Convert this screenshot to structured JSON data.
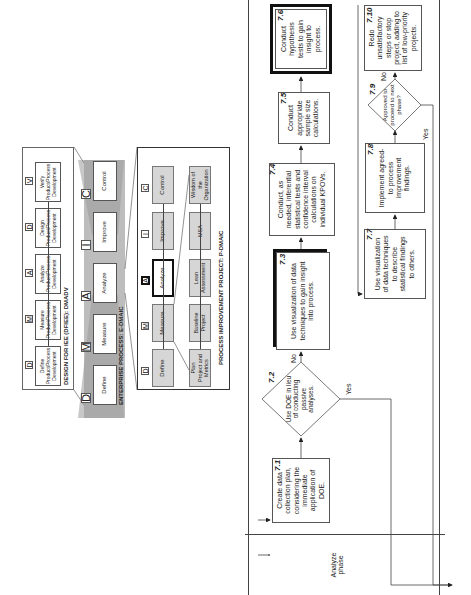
{
  "orientation": "rotated-90-ccw",
  "dmadv": {
    "title": "DESIGN FOR IEE (DFIEE): DMADV",
    "steps": [
      {
        "letter": "D",
        "label": "Define Product/Process Development"
      },
      {
        "letter": "M",
        "label": "Measure Product/Process Development"
      },
      {
        "letter": "A",
        "label": "Analyze Product/Process Development"
      },
      {
        "letter": "D",
        "label": "Design Product/Process Development"
      },
      {
        "letter": "V",
        "label": "Verify Product/Process Development"
      }
    ]
  },
  "edmaic": {
    "title": "ENTERPRISE PROCESS: E-DMAIC",
    "steps": [
      {
        "letter": "D",
        "label": "Define"
      },
      {
        "letter": "M",
        "label": "Measure"
      },
      {
        "letter": "A",
        "label": "Analyze"
      },
      {
        "letter": "I",
        "label": "Improve"
      },
      {
        "letter": "C",
        "label": "Control"
      }
    ]
  },
  "pdmaic": {
    "title": "PROCESS IMPROVEMENT PROJECT: P-DMAIC",
    "steps": [
      {
        "letter": "D",
        "label": "Define"
      },
      {
        "letter": "M",
        "label": "Measure"
      },
      {
        "letter": "A",
        "label": "Analyze"
      },
      {
        "letter": "I",
        "label": "Improve"
      },
      {
        "letter": "C",
        "label": "Control"
      }
    ],
    "support": [
      "Plan Project and Metrics",
      "Baseline Project",
      "Lean Assessment",
      "MSA",
      "Wisdom of the Organization"
    ]
  },
  "flow": {
    "phase_label": "Analyze phase",
    "steps": {
      "s71": {
        "num": "7.1",
        "text": "Create data collection plan, considering the immediate application of DOE."
      },
      "s72": {
        "num": "7.2",
        "text": "Use DOE in lieu of conducting passive analyses."
      },
      "s73": {
        "num": "7.3",
        "text": "Use visualization of data techniques to gain insight into process."
      },
      "s74": {
        "num": "7.4",
        "text": "Conduct, as needed, inferential statistical tests and confidence interval calculations on individual KPOVs."
      },
      "s75": {
        "num": "7.5",
        "text": "Conduct appropriate sample size calculations."
      },
      "s76": {
        "num": "7.6",
        "text": "Conduct hypothesis tests to gain insight to process."
      },
      "s77": {
        "num": "7.7",
        "text": "Use visualization of data techniques to describe statistical findings to others."
      },
      "s78": {
        "num": "7.8",
        "text": "Implement agreed-to process improvement findings."
      },
      "s79": {
        "num": "7.9",
        "text": "Approved to proceed to next phase?"
      },
      "s710": {
        "num": "7.10",
        "text": "Redo unsatisfactory steps or stop project, adding to list of low-priority projects."
      }
    },
    "labels": {
      "no_72": "No",
      "yes_72": "Yes",
      "no_79": "No",
      "yes_79": "Yes"
    }
  }
}
